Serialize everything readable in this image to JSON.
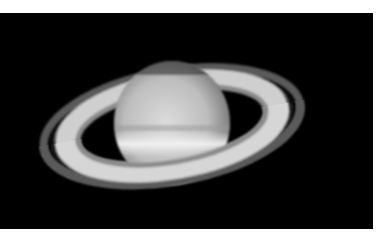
{
  "image": {
    "subject": "Saturn with rings",
    "alt": "Telescopic photograph of the planet Saturn and its ring system against a black sky",
    "colors": {
      "background": "#000000",
      "border": "#ffffff",
      "planet_light": "#e8e8e8",
      "planet_dark": "#8a8a8a",
      "ring_bright": "#d0d0d0",
      "ring_dim": "#6a6a6a"
    }
  }
}
